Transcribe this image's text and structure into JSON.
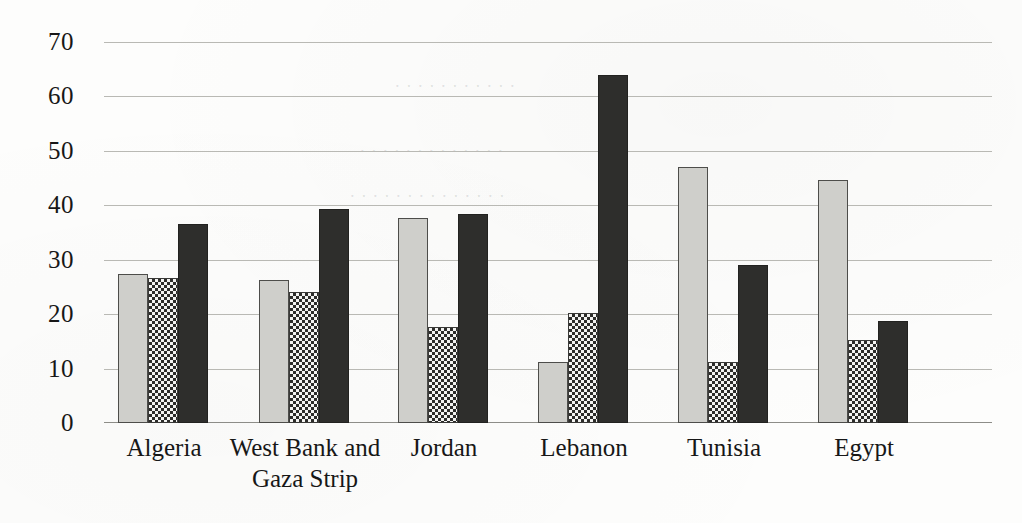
{
  "chart_data": {
    "type": "bar",
    "title": "",
    "subtitle": "",
    "xlabel": "",
    "ylabel": "",
    "ylim": [
      0,
      70
    ],
    "yticks": [
      0,
      10,
      20,
      30,
      40,
      50,
      60,
      70
    ],
    "ytick_labels": [
      "0",
      "10",
      "20",
      "30",
      "40",
      "50",
      "60",
      "70"
    ],
    "grid": true,
    "legend": "none",
    "categories": [
      "Algeria",
      "West Bank and Gaza Strip",
      "Jordan",
      "Lebanon",
      "Tunisia",
      "Egypt"
    ],
    "category_lines": [
      [
        "Algeria"
      ],
      [
        "West Bank and",
        "Gaza Strip"
      ],
      [
        "Jordan"
      ],
      [
        "Lebanon"
      ],
      [
        "Tunisia"
      ],
      [
        "Egypt"
      ]
    ],
    "series": [
      {
        "name": "series-1",
        "fill": "light-gray-solid",
        "color": "#cfcfcb",
        "values": [
          27.3,
          26.2,
          37.6,
          11.2,
          47.0,
          44.6
        ]
      },
      {
        "name": "series-2",
        "fill": "checkerboard-pattern",
        "color": "#2c2c2a",
        "values": [
          26.7,
          24.0,
          17.6,
          20.2,
          11.3,
          15.3
        ]
      },
      {
        "name": "series-3",
        "fill": "dark-solid",
        "color": "#2e2e2c",
        "values": [
          36.6,
          39.3,
          38.4,
          64.0,
          29.1,
          18.8
        ]
      }
    ]
  },
  "geometry": {
    "plot_left": 104,
    "plot_top": 42,
    "plot_width": 888,
    "plot_height": 381,
    "group_starts": [
      14,
      155,
      294,
      434,
      574,
      714
    ],
    "group_span": 92,
    "bar_width": 30
  }
}
